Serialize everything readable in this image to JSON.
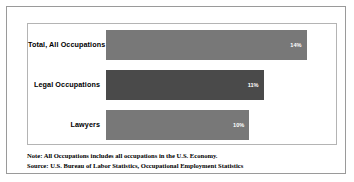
{
  "chart_data": {
    "type": "bar",
    "orientation": "horizontal",
    "title": "",
    "xlabel": "",
    "ylabel": "",
    "categories": [
      "Total, All Occupations",
      "Legal Occupations",
      "Lawyers"
    ],
    "values": [
      14,
      11,
      10
    ],
    "value_labels": [
      "14%",
      "11%",
      "10%"
    ],
    "xlim": [
      0,
      15.5
    ],
    "grid": false,
    "legend": false,
    "bar_colors": [
      "#787878",
      "#4a4a4a",
      "#787878"
    ],
    "value_label_color": "#ffffff",
    "background": "#ffffff",
    "bars": [
      {
        "category": "Total, All Occupations",
        "value": 14,
        "label": "14%",
        "color": "#787878"
      },
      {
        "category": "Legal Occupations",
        "value": 11,
        "label": "11%",
        "color": "#4a4a4a"
      },
      {
        "category": "Lawyers",
        "value": 10,
        "label": "10%",
        "color": "#787878"
      }
    ]
  },
  "footnote": {
    "note": "Note: All Occupations includes all occupations in the U.S. Economy.",
    "source": "Source: U.S. Bureau of Labor Statistics, Occupational Employment Statistics"
  }
}
